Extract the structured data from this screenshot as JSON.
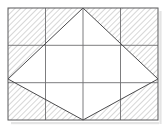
{
  "figure": {
    "title": "Rectangle with inscribed rhombus and hatched corner regions",
    "type": "geometry-diagram",
    "canvas": {
      "width": 166,
      "height": 136
    },
    "background_color": "#ffffff"
  },
  "colors": {
    "outline": "#58585a",
    "grid_line": "#6e6e70",
    "rhombus_edge": "#4a4a4c",
    "hatch_line": "#9a9a9c",
    "unshaded_fill": "#ffffff",
    "shadow": "#cfcfcf"
  },
  "rectangle": {
    "label": "outer-rectangle",
    "left": 8,
    "top": 8,
    "right": 158,
    "bottom": 120,
    "width": 150,
    "height": 112,
    "stroke_width": 1
  },
  "grid": {
    "label": "interior-grid",
    "vertical_divisions": 4,
    "horizontal_divisions": 3,
    "vertical_lines_x": [
      45.5,
      83,
      120.5
    ],
    "horizontal_lines_y": [
      45.3,
      82.7
    ],
    "stroke_width": 0.9
  },
  "rhombus": {
    "label": "inscribed-rhombus",
    "vertices": [
      {
        "name": "top-apex",
        "x": 83,
        "y": 8
      },
      {
        "name": "right-apex",
        "x": 158,
        "y": 79
      },
      {
        "name": "bottom-apex",
        "x": 83,
        "y": 120
      },
      {
        "name": "left-apex",
        "x": 8,
        "y": 79
      }
    ],
    "fill": "#ffffff",
    "stroke_width": 1
  },
  "hatched_regions": [
    {
      "name": "top-left-corner-triangle",
      "points": "8,8 83,8 8,79"
    },
    {
      "name": "top-right-corner-triangle",
      "points": "83,8 158,8 158,79"
    },
    {
      "name": "bottom-right-corner-triangle",
      "points": "158,79 158,120 83,120"
    },
    {
      "name": "bottom-left-corner-triangle",
      "points": "8,79 83,120 8,120"
    }
  ],
  "hatch_pattern": {
    "label": "diagonal-hatch",
    "angle_degrees": 45,
    "spacing_px": 4,
    "stroke_width": 0.8,
    "stroke_color": "#9a9a9c"
  }
}
